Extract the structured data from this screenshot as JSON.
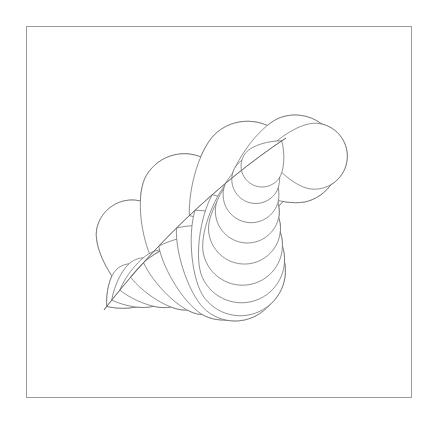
{
  "document": {
    "title": "Feathered Quilting Block Pattern",
    "kind": "line-drawing",
    "background_color": "#ffffff"
  },
  "canvas": {
    "width": 436,
    "height": 422
  },
  "frame": {
    "x": 26,
    "y": 26,
    "width": 386,
    "height": 372,
    "stroke_color": "#9a9a9a",
    "stroke_width": 1,
    "fill": "none"
  },
  "style": {
    "line_color": "#5f5f5f",
    "line_width": 0.7,
    "fill_color": "#ffffff"
  },
  "pattern": {
    "name": "double-feather-plume",
    "symmetry": "180-degree-rotational",
    "center": {
      "x": 219,
      "y": 212
    },
    "plume_count_total": 40,
    "description": "Two mirrored feather spines sweeping corner to corner, each lined with overlapping teardrop plumes that shrink toward the spine tips."
  },
  "feathers": [
    {
      "id": "feather-upper-left",
      "spine": {
        "start": {
          "x": 286,
          "y": 138
        },
        "c1": {
          "x": 215,
          "y": 185
        },
        "c2": {
          "x": 150,
          "y": 250
        },
        "end": {
          "x": 104,
          "y": 310
        }
      },
      "outer_side": "left",
      "plumes": [
        {
          "i": 0,
          "anchor_t": 0.02,
          "radius": 21,
          "angle_deg": -18,
          "reach": 1.52
        },
        {
          "i": 1,
          "anchor_t": 0.06,
          "radius": 24,
          "angle_deg": -27,
          "reach": 1.55
        },
        {
          "i": 2,
          "anchor_t": 0.1,
          "radius": 28,
          "angle_deg": -36,
          "reach": 1.58
        },
        {
          "i": 3,
          "anchor_t": 0.15,
          "radius": 32,
          "angle_deg": -45,
          "reach": 1.6
        },
        {
          "i": 4,
          "anchor_t": 0.21,
          "radius": 36,
          "angle_deg": -54,
          "reach": 1.62
        },
        {
          "i": 5,
          "anchor_t": 0.28,
          "radius": 40,
          "angle_deg": -63,
          "reach": 1.64
        },
        {
          "i": 6,
          "anchor_t": 0.36,
          "radius": 43,
          "angle_deg": -73,
          "reach": 1.66
        },
        {
          "i": 7,
          "anchor_t": 0.45,
          "radius": 45,
          "angle_deg": -84,
          "reach": 1.68
        },
        {
          "i": 8,
          "anchor_t": 0.55,
          "radius": 45,
          "angle_deg": -96,
          "reach": 1.68
        },
        {
          "i": 9,
          "anchor_t": 0.65,
          "radius": 43,
          "angle_deg": -108,
          "reach": 1.66
        },
        {
          "i": 10,
          "anchor_t": 0.74,
          "radius": 39,
          "angle_deg": -120,
          "reach": 1.62
        },
        {
          "i": 11,
          "anchor_t": 0.82,
          "radius": 34,
          "angle_deg": -132,
          "reach": 1.58
        },
        {
          "i": 12,
          "anchor_t": 0.89,
          "radius": 29,
          "angle_deg": -144,
          "reach": 1.54
        },
        {
          "i": 13,
          "anchor_t": 0.945,
          "radius": 25,
          "angle_deg": -156,
          "reach": 1.5
        },
        {
          "i": 14,
          "anchor_t": 0.98,
          "radius": 22,
          "angle_deg": -168,
          "reach": 1.46
        }
      ],
      "inner_plumes": [
        {
          "i": 0,
          "anchor_t": 0.1,
          "radius": 33,
          "angle_deg": 40,
          "reach": 1.5
        },
        {
          "i": 1,
          "anchor_t": 0.27,
          "radius": 44,
          "angle_deg": 22,
          "reach": 1.55
        },
        {
          "i": 2,
          "anchor_t": 0.48,
          "radius": 48,
          "angle_deg": 5,
          "reach": 1.55
        },
        {
          "i": 3,
          "anchor_t": 0.7,
          "radius": 44,
          "angle_deg": -12,
          "reach": 1.52
        },
        {
          "i": 4,
          "anchor_t": 0.88,
          "radius": 36,
          "angle_deg": -28,
          "reach": 1.48
        }
      ]
    },
    {
      "id": "feather-lower-right",
      "spine": {
        "start": {
          "x": 152,
          "y": 286
        },
        "c1": {
          "x": 223,
          "y": 239
        },
        "c2": {
          "x": 288,
          "y": 174
        },
        "end": {
          "x": 334,
          "y": 114
        }
      },
      "outer_side": "left",
      "plumes": [
        {
          "i": 0,
          "anchor_t": 0.02,
          "radius": 21,
          "angle_deg": -18,
          "reach": 1.52
        },
        {
          "i": 1,
          "anchor_t": 0.06,
          "radius": 24,
          "angle_deg": -27,
          "reach": 1.55
        },
        {
          "i": 2,
          "anchor_t": 0.1,
          "radius": 28,
          "angle_deg": -36,
          "reach": 1.58
        },
        {
          "i": 3,
          "anchor_t": 0.15,
          "radius": 32,
          "angle_deg": -45,
          "reach": 1.6
        },
        {
          "i": 4,
          "anchor_t": 0.21,
          "radius": 36,
          "angle_deg": -54,
          "reach": 1.62
        },
        {
          "i": 5,
          "anchor_t": 0.28,
          "radius": 40,
          "angle_deg": -63,
          "reach": 1.64
        },
        {
          "i": 6,
          "anchor_t": 0.36,
          "radius": 43,
          "angle_deg": -73,
          "reach": 1.66
        },
        {
          "i": 7,
          "anchor_t": 0.45,
          "radius": 45,
          "angle_deg": -84,
          "reach": 1.68
        },
        {
          "i": 8,
          "anchor_t": 0.55,
          "radius": 45,
          "angle_deg": -96,
          "reach": 1.68
        },
        {
          "i": 9,
          "anchor_t": 0.65,
          "radius": 43,
          "angle_deg": -108,
          "reach": 1.66
        },
        {
          "i": 10,
          "anchor_t": 0.74,
          "radius": 39,
          "angle_deg": -120,
          "reach": 1.62
        },
        {
          "i": 11,
          "anchor_t": 0.82,
          "radius": 34,
          "angle_deg": -132,
          "reach": 1.58
        },
        {
          "i": 12,
          "anchor_t": 0.89,
          "radius": 29,
          "angle_deg": -144,
          "reach": 1.54
        },
        {
          "i": 13,
          "anchor_t": 0.945,
          "radius": 25,
          "angle_deg": -156,
          "reach": 1.5
        },
        {
          "i": 14,
          "anchor_t": 0.98,
          "radius": 22,
          "angle_deg": -168,
          "reach": 1.46
        }
      ],
      "inner_plumes": [
        {
          "i": 0,
          "anchor_t": 0.1,
          "radius": 33,
          "angle_deg": 40,
          "reach": 1.5
        },
        {
          "i": 1,
          "anchor_t": 0.27,
          "radius": 44,
          "angle_deg": 22,
          "reach": 1.55
        },
        {
          "i": 2,
          "anchor_t": 0.48,
          "radius": 48,
          "angle_deg": 5,
          "reach": 1.55
        },
        {
          "i": 3,
          "anchor_t": 0.7,
          "radius": 44,
          "angle_deg": -12,
          "reach": 1.52
        },
        {
          "i": 4,
          "anchor_t": 0.88,
          "radius": 36,
          "angle_deg": -28,
          "reach": 1.48
        }
      ]
    }
  ]
}
